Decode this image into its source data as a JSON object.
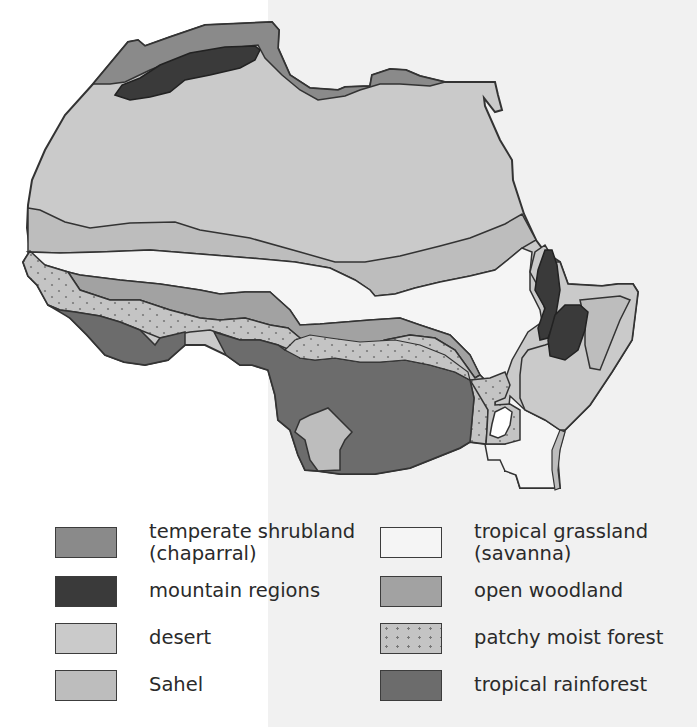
{
  "map": {
    "subject": "Vegetation zones of Africa",
    "colors": {
      "temperate_shrubland": "#8a8a8a",
      "mountain": "#3a3a3a",
      "desert": "#cacaca",
      "sahel": "#bdbdbd",
      "savanna": "#f5f5f5",
      "open_woodland": "#a2a2a2",
      "patchy_moist_forest": "#c4c4c4",
      "tropical_rainforest": "#6c6c6c",
      "outline": "#333333"
    }
  },
  "legend": {
    "items": [
      {
        "key": "temperate_shrubland",
        "label": "temperate shrubland\n(chaparral)",
        "color": "#8a8a8a",
        "pattern": "solid"
      },
      {
        "key": "mountain",
        "label": "mountain regions",
        "color": "#3a3a3a",
        "pattern": "solid"
      },
      {
        "key": "desert",
        "label": "desert",
        "color": "#cacaca",
        "pattern": "solid"
      },
      {
        "key": "sahel",
        "label": "Sahel",
        "color": "#bdbdbd",
        "pattern": "solid"
      },
      {
        "key": "savanna",
        "label": "tropical grassland\n(savanna)",
        "color": "#f5f5f5",
        "pattern": "solid"
      },
      {
        "key": "open_woodland",
        "label": "open woodland",
        "color": "#a2a2a2",
        "pattern": "solid"
      },
      {
        "key": "patchy_moist_forest",
        "label": "patchy moist forest",
        "color": "#c4c4c4",
        "pattern": "dotted"
      },
      {
        "key": "tropical_rainforest",
        "label": "tropical rainforest",
        "color": "#6c6c6c",
        "pattern": "solid"
      }
    ]
  }
}
